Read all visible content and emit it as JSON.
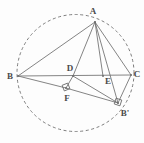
{
  "figure": {
    "background_color": "#fdfdfd",
    "stroke_color": "#6e6e6e",
    "label_color": "#4a4a4a",
    "circle": {
      "name": "circumcircle",
      "style": "dashed",
      "cx": 75.5,
      "cy": 73,
      "r": 58.5,
      "dash": "3 2.6"
    },
    "points": [
      {
        "id": "A",
        "label": "A",
        "px": 95,
        "py": 22,
        "lx": 93,
        "ly": 11
      },
      {
        "id": "B",
        "label": "B",
        "px": 18,
        "py": 76,
        "lx": 10,
        "ly": 76
      },
      {
        "id": "C",
        "label": "C",
        "px": 131,
        "py": 75,
        "lx": 137,
        "ly": 74
      },
      {
        "id": "D",
        "label": "D",
        "px": 73,
        "py": 76,
        "lx": 70,
        "ly": 68
      },
      {
        "id": "E",
        "label": "E",
        "px": 103,
        "py": 76,
        "lx": 108,
        "ly": 81
      },
      {
        "id": "F",
        "label": "F",
        "px": 66,
        "py": 88,
        "lx": 67,
        "ly": 98
      },
      {
        "id": "Bp",
        "label": "B'",
        "px": 118,
        "py": 103,
        "lx": 125,
        "ly": 113
      }
    ],
    "segments": [
      {
        "id": "seg-BA",
        "from": "B",
        "to": "A"
      },
      {
        "id": "seg-AC",
        "from": "A",
        "to": "C"
      },
      {
        "id": "seg-BC",
        "from": "B",
        "to": "C"
      },
      {
        "id": "seg-AD",
        "from": "A",
        "to": "D"
      },
      {
        "id": "seg-AE",
        "from": "A",
        "to": "E"
      },
      {
        "id": "seg-ABp",
        "from": "A",
        "to": "Bp"
      },
      {
        "id": "seg-BF",
        "from": "B",
        "to": "F"
      },
      {
        "id": "seg-FBp",
        "from": "F",
        "to": "Bp"
      },
      {
        "id": "seg-DF",
        "from": "D",
        "to": "F"
      },
      {
        "id": "seg-DBp",
        "from": "D",
        "to": "Bp"
      },
      {
        "id": "seg-CBp",
        "from": "C",
        "to": "Bp"
      }
    ],
    "right_angle_marks": [
      {
        "id": "ra-F",
        "at": "F",
        "cx": 66,
        "cy": 87,
        "size": 6,
        "rotate": -22
      },
      {
        "id": "ra-Bp",
        "at": "Bp",
        "cx": 118,
        "cy": 102,
        "size": 6,
        "rotate": 18
      }
    ]
  }
}
